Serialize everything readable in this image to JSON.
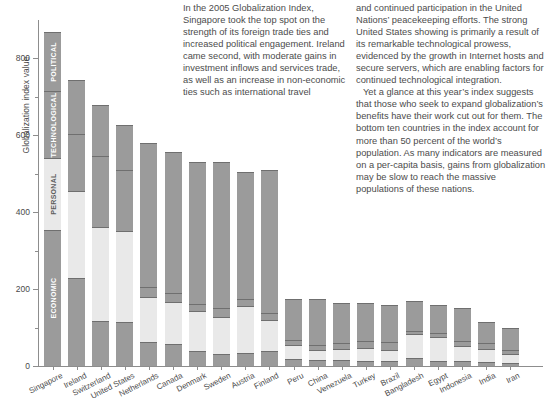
{
  "chart_data": {
    "type": "bar",
    "subtype": "stacked-vertical",
    "title": "",
    "xlabel": "",
    "ylabel": "Globalization index value",
    "ylim": [
      0,
      900
    ],
    "yticks": [
      0,
      200,
      400,
      600,
      800
    ],
    "yticks_minor": [
      100,
      300,
      500,
      700
    ],
    "grid": false,
    "legend_position": "in-first-bar",
    "legend_note": "Category names are printed inside the first (Singapore) bar segments",
    "stack_order_bottom_to_top": [
      "ECONOMIC",
      "PERSONAL",
      "TECHNOLOGICAL",
      "POLITICAL"
    ],
    "segment_colors": {
      "ECONOMIC": "#9b9b9b",
      "PERSONAL": "#e9e9e9",
      "TECHNOLOGICAL": "#9b9b9b",
      "POLITICAL": "#9b9b9b"
    },
    "categories": [
      "Singapore",
      "Ireland",
      "Switzerland",
      "United States",
      "Netherlands",
      "Canada",
      "Denmark",
      "Sweden",
      "Austria",
      "Finland",
      "Peru",
      "China",
      "Venezuela",
      "Turkey",
      "Brazil",
      "Bangladesh",
      "Egypt",
      "Indonesia",
      "India",
      "Iran"
    ],
    "series": [
      {
        "name": "ECONOMIC",
        "values": [
          355,
          228,
          116,
          114,
          62,
          56,
          40,
          30,
          33,
          40,
          18,
          16,
          15,
          14,
          12,
          22,
          13,
          12,
          10,
          8
        ]
      },
      {
        "name": "PERSONAL",
        "values": [
          185,
          228,
          245,
          236,
          118,
          110,
          102,
          98,
          122,
          80,
          38,
          26,
          30,
          32,
          30,
          60,
          62,
          40,
          35,
          22
        ]
      },
      {
        "name": "TECHNOLOGICAL",
        "values": [
          175,
          148,
          185,
          160,
          26,
          24,
          20,
          22,
          20,
          18,
          12,
          14,
          14,
          20,
          20,
          10,
          12,
          12,
          14,
          12
        ]
      },
      {
        "name": "POLITICAL",
        "values": [
          155,
          141,
          134,
          118,
          374,
          368,
          368,
          380,
          330,
          372,
          107,
          119,
          106,
          99,
          98,
          78,
          73,
          86,
          55,
          58
        ]
      }
    ],
    "totals": [
      870,
      745,
      680,
      628,
      580,
      558,
      530,
      530,
      505,
      510,
      175,
      175,
      165,
      165,
      160,
      170,
      160,
      150,
      114,
      100
    ]
  },
  "axis": {
    "ylabel": "Globalization index value",
    "tick_labels": [
      "800",
      "600",
      "400",
      "200",
      "0"
    ],
    "tick_values": [
      800,
      600,
      400,
      200,
      0
    ]
  },
  "legend": {
    "items": [
      {
        "label": "POLITICAL",
        "tone": "dark"
      },
      {
        "label": "TECHNOLOGICAL",
        "tone": "dark"
      },
      {
        "label": "PERSONAL",
        "tone": "light"
      },
      {
        "label": "ECONOMIC",
        "tone": "dark"
      }
    ]
  },
  "article": {
    "column1": [
      "In the 2005 Globalization Index, Singapore took the top spot on the strength of its foreign trade ties and increased political engagement. Ireland came second, with moderate gains in investment inflows and services trade, as well as an increase in non-economic ties such as international travel"
    ],
    "column2": [
      "and continued participation in the United Nations’ peacekeeping efforts. The strong United States showing is primarily a result of its remarkable technological prowess, evidenced by the growth in Internet hosts and secure servers, which are enabling factors for continued technological integration.",
      "Yet a glance at this year’s index suggests that those who seek to expand globalization’s benefits have their work cut out for them. The bottom ten countries in the index account for more than 50 percent of the world’s population. As many indicators are measured on a per-capita basis, gains from globalization may be slow to reach the massive populations of these nations."
    ]
  }
}
